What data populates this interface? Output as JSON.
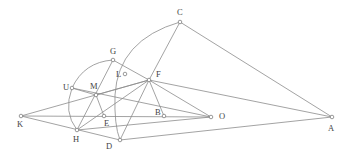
{
  "diagram": {
    "points": [
      {
        "id": "C",
        "label": "C",
        "x": 180,
        "y": 22,
        "lx": 177,
        "ly": 15
      },
      {
        "id": "G",
        "label": "G",
        "x": 113,
        "y": 60,
        "lx": 110,
        "ly": 54
      },
      {
        "id": "L",
        "label": "L",
        "x": 125,
        "y": 74,
        "lx": 116,
        "ly": 77
      },
      {
        "id": "F",
        "label": "F",
        "x": 149,
        "y": 80,
        "lx": 156,
        "ly": 77
      },
      {
        "id": "U",
        "label": "U",
        "x": 72,
        "y": 88,
        "lx": 63,
        "ly": 90
      },
      {
        "id": "M",
        "label": "M",
        "x": 96,
        "y": 95,
        "lx": 90,
        "ly": 89
      },
      {
        "id": "K",
        "label": "K",
        "x": 21,
        "y": 116,
        "lx": 17,
        "ly": 127
      },
      {
        "id": "E",
        "label": "E",
        "x": 104,
        "y": 116,
        "lx": 104,
        "ly": 126
      },
      {
        "id": "B",
        "label": "B",
        "x": 164,
        "y": 116,
        "lx": 155,
        "ly": 115
      },
      {
        "id": "O",
        "label": "O",
        "x": 211,
        "y": 117,
        "lx": 219,
        "ly": 119
      },
      {
        "id": "A",
        "label": "A",
        "x": 332,
        "y": 117,
        "lx": 328,
        "ly": 131
      },
      {
        "id": "H",
        "label": "H",
        "x": 77,
        "y": 130,
        "lx": 73,
        "ly": 142
      },
      {
        "id": "D",
        "label": "D",
        "x": 120,
        "y": 140,
        "lx": 106,
        "ly": 149
      }
    ],
    "segments": [
      [
        "C",
        "A"
      ],
      [
        "C",
        "F"
      ],
      [
        "F",
        "D"
      ],
      [
        "G",
        "F"
      ],
      [
        "G",
        "H"
      ],
      [
        "F",
        "A"
      ],
      [
        "F",
        "O"
      ],
      [
        "F",
        "B"
      ],
      [
        "K",
        "F"
      ],
      [
        "K",
        "O"
      ],
      [
        "K",
        "D"
      ],
      [
        "U",
        "O"
      ],
      [
        "M",
        "E"
      ],
      [
        "M",
        "F"
      ],
      [
        "H",
        "F"
      ],
      [
        "H",
        "O"
      ],
      [
        "D",
        "A"
      ],
      [
        "U",
        "M"
      ]
    ],
    "arcs": [
      {
        "name": "arc-C-L-D",
        "d": "M180,22 Q118,40 115,95 Q114,125 120,140"
      },
      {
        "name": "arc-U-G",
        "d": "M72,88 Q84,62 113,60"
      },
      {
        "name": "arc-U-H",
        "d": "M72,88 Q63,112 77,130"
      }
    ]
  }
}
